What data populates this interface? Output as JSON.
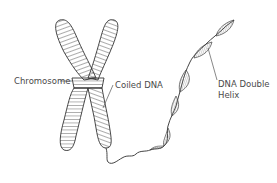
{
  "diagram": {
    "labels": {
      "chromosome": "Chromosome",
      "coiled_dna": "Coiled DNA",
      "helix_line1": "DNA Double",
      "helix_line2": "Helix"
    },
    "colors": {
      "stroke": "#3a3a3a",
      "hatch": "#555555",
      "helix_fill": "#d6d6d6",
      "text": "#4a4a4a",
      "background": "#ffffff"
    }
  }
}
